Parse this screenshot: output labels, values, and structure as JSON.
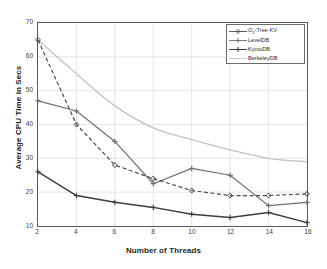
{
  "chart_data": {
    "type": "line",
    "title": "",
    "subtitle": "",
    "xlabel": "Number of Threads",
    "ylabel": "Average CPU Time in Secs",
    "x": [
      2,
      4,
      6,
      8,
      10,
      12,
      14,
      16
    ],
    "xticks": [
      "2",
      "4",
      "6",
      "8",
      "10",
      "12",
      "14",
      "16"
    ],
    "yticks": [
      "10",
      "20",
      "30",
      "40",
      "50",
      "60",
      "70"
    ],
    "xlim": [
      2,
      16
    ],
    "ylim": [
      10,
      70
    ],
    "grid": true,
    "legend_position": "top-right",
    "series": [
      {
        "name": "O2-Tree KV",
        "name_parts": {
          "pre": "O",
          "sub": "2",
          "post": "-Tree KV"
        },
        "values": [
          65,
          40,
          28,
          24,
          20.5,
          19,
          19,
          19.5
        ],
        "style": "dashed",
        "marker": "diamond",
        "color": "#4a4a4a"
      },
      {
        "name": "LevelDB",
        "values": [
          47,
          44,
          35,
          22.5,
          27,
          25,
          16,
          17
        ],
        "style": "solid",
        "marker": "plus",
        "color": "#6e6e6e"
      },
      {
        "name": "KyotoDB",
        "values": [
          26,
          19,
          17,
          15.5,
          13.5,
          12.5,
          14,
          11
        ],
        "style": "solid",
        "marker": "plus",
        "color": "#3d3d3d"
      },
      {
        "name": "BerkeleyDB",
        "values": [
          65,
          55,
          45.5,
          39,
          35.5,
          32.5,
          30,
          29
        ],
        "style": "solid",
        "marker": "none",
        "color": "#c2c2c2"
      }
    ]
  },
  "legend": {
    "items": [
      {
        "label": "O2-Tree KV",
        "pre": "O",
        "sub": "2",
        "post": "-Tree KV"
      },
      {
        "label": "LevelDB"
      },
      {
        "label": "KyotoDB"
      },
      {
        "label": "BerkeleyDB"
      }
    ]
  }
}
